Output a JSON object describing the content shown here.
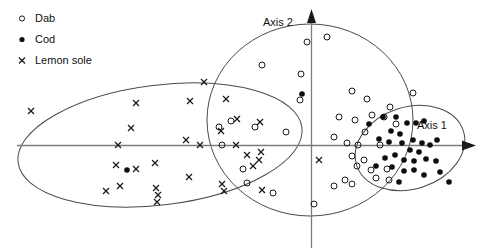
{
  "figure": {
    "width": 499,
    "height": 248,
    "background": "#ffffff"
  },
  "legend": {
    "position": "top-left",
    "items": [
      {
        "label": "Dab",
        "marker": "open-circle",
        "marker_name": "open-circle-marker-icon",
        "color": "#1a1a1a"
      },
      {
        "label": "Cod",
        "marker": "filled-circle",
        "marker_name": "filled-circle-marker-icon",
        "color": "#0d0d0d"
      },
      {
        "label": "Lemon sole",
        "marker": "cross",
        "marker_name": "cross-marker-icon",
        "color": "#1a1a1a"
      }
    ]
  },
  "axes": {
    "x_label": "Axis 1",
    "y_label": "Axis 2",
    "x_line": {
      "x1": 17,
      "y1": 145.5,
      "x2": 468,
      "y2": 145.5
    },
    "y_line": {
      "x1": 311.5,
      "y1": 248,
      "x2": 311.5,
      "y2": 17
    },
    "x_arrow_tip": {
      "x": 476,
      "y": 145.5
    },
    "y_arrow_tip": {
      "x": 311.5,
      "y": 9
    },
    "x_label_pos": {
      "x": 432,
      "y": 129
    },
    "y_label_pos": {
      "x": 263,
      "y": 26
    },
    "axis_color": "#7b7b7b",
    "ticks": [],
    "grid": false
  },
  "chart_data": {
    "type": "scatter",
    "title": "",
    "subtitle": "",
    "xlabel": "Axis 1",
    "ylabel": "Axis 2",
    "xlim": [
      17,
      476
    ],
    "ylim": [
      9,
      248
    ],
    "grid": false,
    "legend_position": "top-left",
    "note": "Ordination biplot of three fish species with convex-hull / ellipse group boundaries. Coordinates are given in pixel space of the original figure; the origin of the data axes lies at the crossing point (311.5, 145.5).",
    "origin_px": {
      "x": 311.5,
      "y": 145.5
    },
    "series": [
      {
        "name": "Dab",
        "marker": "open-circle",
        "marker_radius": 3,
        "color": "#1a1a1a",
        "count": 38,
        "points": [
          {
            "x": 307,
            "y": 42
          },
          {
            "x": 327,
            "y": 37
          },
          {
            "x": 262,
            "y": 65
          },
          {
            "x": 231,
            "y": 121
          },
          {
            "x": 301,
            "y": 74
          },
          {
            "x": 367,
            "y": 99
          },
          {
            "x": 413,
            "y": 93
          },
          {
            "x": 300,
            "y": 100
          },
          {
            "x": 352,
            "y": 91
          },
          {
            "x": 355,
            "y": 120
          },
          {
            "x": 372,
            "y": 115
          },
          {
            "x": 339,
            "y": 117
          },
          {
            "x": 365,
            "y": 132
          },
          {
            "x": 384,
            "y": 117
          },
          {
            "x": 390,
            "y": 107
          },
          {
            "x": 396,
            "y": 124
          },
          {
            "x": 219,
            "y": 127
          },
          {
            "x": 255,
            "y": 127
          },
          {
            "x": 286,
            "y": 132
          },
          {
            "x": 334,
            "y": 137
          },
          {
            "x": 347,
            "y": 143
          },
          {
            "x": 358,
            "y": 145
          },
          {
            "x": 380,
            "y": 145
          },
          {
            "x": 222,
            "y": 145
          },
          {
            "x": 352,
            "y": 156
          },
          {
            "x": 364,
            "y": 160
          },
          {
            "x": 357,
            "y": 166
          },
          {
            "x": 371,
            "y": 170
          },
          {
            "x": 387,
            "y": 169
          },
          {
            "x": 376,
            "y": 178
          },
          {
            "x": 389,
            "y": 180
          },
          {
            "x": 345,
            "y": 180
          },
          {
            "x": 352,
            "y": 184
          },
          {
            "x": 334,
            "y": 186
          },
          {
            "x": 243,
            "y": 169
          },
          {
            "x": 247,
            "y": 183
          },
          {
            "x": 273,
            "y": 193
          },
          {
            "x": 314,
            "y": 204
          }
        ]
      },
      {
        "name": "Cod",
        "marker": "filled-circle",
        "marker_radius": 2.8,
        "color": "#0d0d0d",
        "count": 32,
        "points": [
          {
            "x": 302,
            "y": 94
          },
          {
            "x": 369,
            "y": 124
          },
          {
            "x": 383,
            "y": 117
          },
          {
            "x": 396,
            "y": 117
          },
          {
            "x": 407,
            "y": 123
          },
          {
            "x": 416,
            "y": 123
          },
          {
            "x": 424,
            "y": 121
          },
          {
            "x": 391,
            "y": 131
          },
          {
            "x": 400,
            "y": 134
          },
          {
            "x": 379,
            "y": 139
          },
          {
            "x": 389,
            "y": 142
          },
          {
            "x": 402,
            "y": 143
          },
          {
            "x": 413,
            "y": 140
          },
          {
            "x": 422,
            "y": 143
          },
          {
            "x": 430,
            "y": 145
          },
          {
            "x": 437,
            "y": 140
          },
          {
            "x": 410,
            "y": 150
          },
          {
            "x": 419,
            "y": 152
          },
          {
            "x": 395,
            "y": 155
          },
          {
            "x": 385,
            "y": 158
          },
          {
            "x": 404,
            "y": 160
          },
          {
            "x": 414,
            "y": 161
          },
          {
            "x": 426,
            "y": 159
          },
          {
            "x": 436,
            "y": 161
          },
          {
            "x": 376,
            "y": 166
          },
          {
            "x": 392,
            "y": 167
          },
          {
            "x": 404,
            "y": 171
          },
          {
            "x": 414,
            "y": 170
          },
          {
            "x": 424,
            "y": 175
          },
          {
            "x": 440,
            "y": 172
          },
          {
            "x": 399,
            "y": 182
          },
          {
            "x": 449,
            "y": 182
          },
          {
            "x": 127,
            "y": 170
          }
        ]
      },
      {
        "name": "Lemon sole",
        "marker": "cross",
        "marker_size": 3,
        "color": "#1a1a1a",
        "count": 30,
        "points": [
          {
            "x": 31,
            "y": 111
          },
          {
            "x": 136,
            "y": 103
          },
          {
            "x": 204,
            "y": 82
          },
          {
            "x": 190,
            "y": 101
          },
          {
            "x": 226,
            "y": 99
          },
          {
            "x": 131,
            "y": 128
          },
          {
            "x": 186,
            "y": 140
          },
          {
            "x": 118,
            "y": 145
          },
          {
            "x": 200,
            "y": 145
          },
          {
            "x": 236,
            "y": 145
          },
          {
            "x": 237,
            "y": 119
          },
          {
            "x": 221,
            "y": 131
          },
          {
            "x": 247,
            "y": 155
          },
          {
            "x": 261,
            "y": 152
          },
          {
            "x": 259,
            "y": 160
          },
          {
            "x": 253,
            "y": 166
          },
          {
            "x": 116,
            "y": 165
          },
          {
            "x": 136,
            "y": 169
          },
          {
            "x": 155,
            "y": 163
          },
          {
            "x": 189,
            "y": 177
          },
          {
            "x": 120,
            "y": 186
          },
          {
            "x": 222,
            "y": 184
          },
          {
            "x": 156,
            "y": 188
          },
          {
            "x": 158,
            "y": 195
          },
          {
            "x": 157,
            "y": 202
          },
          {
            "x": 106,
            "y": 191
          },
          {
            "x": 224,
            "y": 191
          },
          {
            "x": 262,
            "y": 190
          },
          {
            "x": 319,
            "y": 160
          },
          {
            "x": 260,
            "y": 122
          }
        ]
      }
    ],
    "group_boundaries": [
      {
        "name": "Lemon sole boundary",
        "group": "Lemon sole",
        "shape": "ellipse",
        "cx": 160,
        "cy": 145,
        "rx": 143,
        "ry": 60,
        "rotation_deg": -7,
        "stroke": "#4a4a4a"
      },
      {
        "name": "Dab boundary",
        "group": "Dab",
        "shape": "ellipse",
        "cx": 310,
        "cy": 120,
        "rx": 103,
        "ry": 96,
        "rotation_deg": 0,
        "stroke": "#4a4a4a"
      },
      {
        "name": "Cod boundary",
        "group": "Cod",
        "shape": "ellipse",
        "cx": 410,
        "cy": 148,
        "rx": 56,
        "ry": 41,
        "rotation_deg": -18,
        "stroke": "#4a4a4a"
      }
    ]
  }
}
